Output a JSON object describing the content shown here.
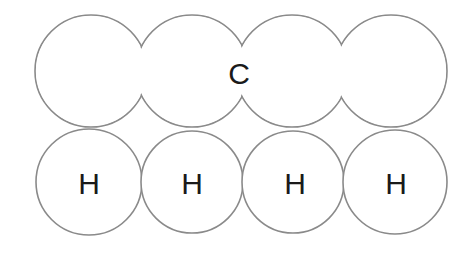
{
  "diagram": {
    "type": "space-filling molecular model",
    "top_row": {
      "atoms": [
        {
          "cx": 91,
          "cy": 71,
          "r": 56,
          "label": ""
        },
        {
          "cx": 192,
          "cy": 71,
          "r": 56,
          "label": ""
        },
        {
          "cx": 292,
          "cy": 71,
          "r": 56,
          "label": ""
        },
        {
          "cx": 391,
          "cy": 71,
          "r": 56,
          "label": ""
        }
      ],
      "center_label": "C"
    },
    "bottom_row": {
      "atoms": [
        {
          "cx": 89,
          "cy": 182,
          "r": 53,
          "label": "H"
        },
        {
          "cx": 192,
          "cy": 182,
          "r": 51,
          "label": "H"
        },
        {
          "cx": 293,
          "cy": 182,
          "r": 51,
          "label": "H"
        },
        {
          "cx": 395,
          "cy": 182,
          "r": 52,
          "label": "H"
        }
      ]
    },
    "colors": {
      "stroke": "#8a8a8a",
      "fill": "#ffffff",
      "text": "#1a1a1a"
    }
  }
}
